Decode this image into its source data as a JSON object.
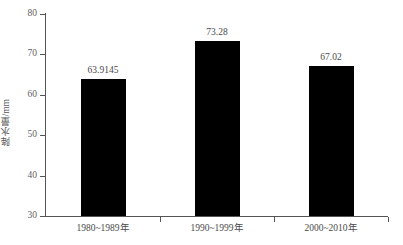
{
  "chart_data": {
    "type": "bar",
    "title": "",
    "xlabel": "",
    "ylabel": "降水量/mm",
    "categories": [
      "1980~1989年",
      "1990~1999年",
      "2000~2010年"
    ],
    "values": [
      63.9145,
      73.28,
      67.02
    ],
    "value_labels": [
      "63.9145",
      "73.28",
      "67.02"
    ],
    "ylim": [
      30,
      80
    ],
    "ytick_labels": [
      "80",
      "70",
      "60",
      "50",
      "40",
      "30"
    ],
    "ytick_values": [
      80,
      70,
      60,
      50,
      40,
      30
    ],
    "grid": false,
    "legend": null,
    "bar_color": "#000000",
    "axis_color": "#555555",
    "text_color": "#4a4a4a"
  }
}
